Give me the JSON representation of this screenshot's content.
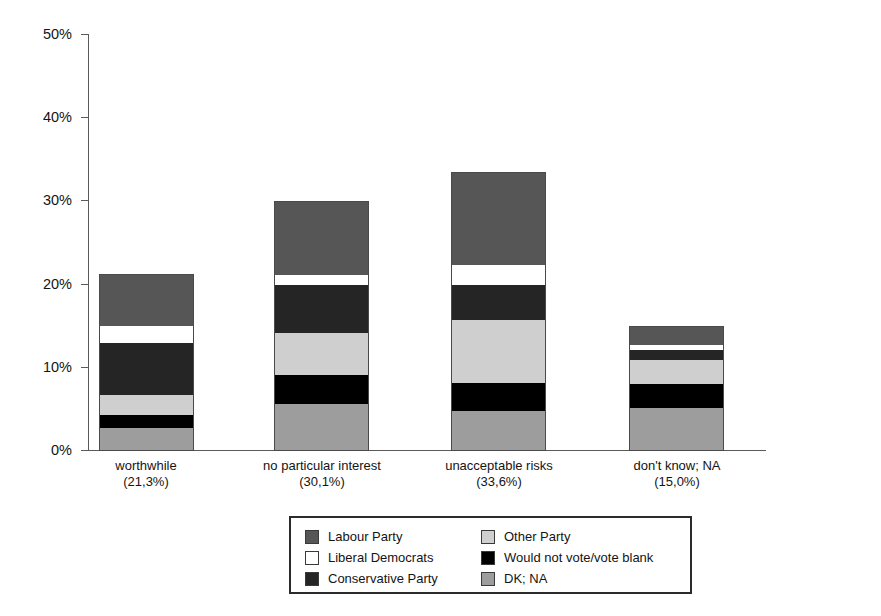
{
  "chart_data": {
    "type": "bar",
    "subtype": "stacked",
    "title": "",
    "xlabel": "",
    "ylabel": "",
    "ylim": [
      0,
      50
    ],
    "ytick_values": [
      0,
      10,
      20,
      30,
      40,
      50
    ],
    "ytick_labels": [
      "0%",
      "10%",
      "20%",
      "30%",
      "40%",
      "50%"
    ],
    "grid": false,
    "legend_position": "bottom-center",
    "categories": [
      "worthwhile",
      "no particular interest",
      "unacceptable risks",
      "don't know; NA"
    ],
    "category_totals": [
      "(21,3%)",
      "(30,1%)",
      "(33,6%)",
      "(15,0%)"
    ],
    "category_total_values": [
      21.3,
      30.1,
      33.6,
      15.0
    ],
    "series": [
      {
        "name": "DK; NA",
        "color": "#9d9d9d",
        "values": [
          2.8,
          5.7,
          4.8,
          5.2
        ]
      },
      {
        "name": "Would not vote/vote blank",
        "color": "#000000",
        "values": [
          1.5,
          3.4,
          3.4,
          2.9
        ]
      },
      {
        "name": "Other Party",
        "color": "#cfcfcf",
        "values": [
          2.4,
          5.1,
          7.6,
          2.9
        ]
      },
      {
        "name": "Conservative Party",
        "color": "#252525",
        "values": [
          6.3,
          5.8,
          4.2,
          1.2
        ]
      },
      {
        "name": "Liberal Democrats",
        "color": "#ffffff",
        "values": [
          2.0,
          1.2,
          2.4,
          0.5
        ]
      },
      {
        "name": "Labour Party",
        "color": "#565656",
        "values": [
          6.3,
          8.9,
          11.2,
          2.3
        ]
      }
    ],
    "stack_order_bottom_to_top": [
      "DK; NA",
      "Would not vote/vote blank",
      "Other Party",
      "Conservative Party",
      "Liberal Democrats",
      "Labour Party"
    ]
  },
  "legend": {
    "entries": [
      {
        "label": "Labour Party",
        "swatch": "#565656"
      },
      {
        "label": "Other Party",
        "swatch": "#cfcfcf"
      },
      {
        "label": "Liberal Democrats",
        "swatch": "#ffffff"
      },
      {
        "label": "Would not vote/vote blank",
        "swatch": "#000000"
      },
      {
        "label": "Conservative Party",
        "swatch": "#252525"
      },
      {
        "label": "DK; NA",
        "swatch": "#9d9d9d"
      }
    ]
  }
}
